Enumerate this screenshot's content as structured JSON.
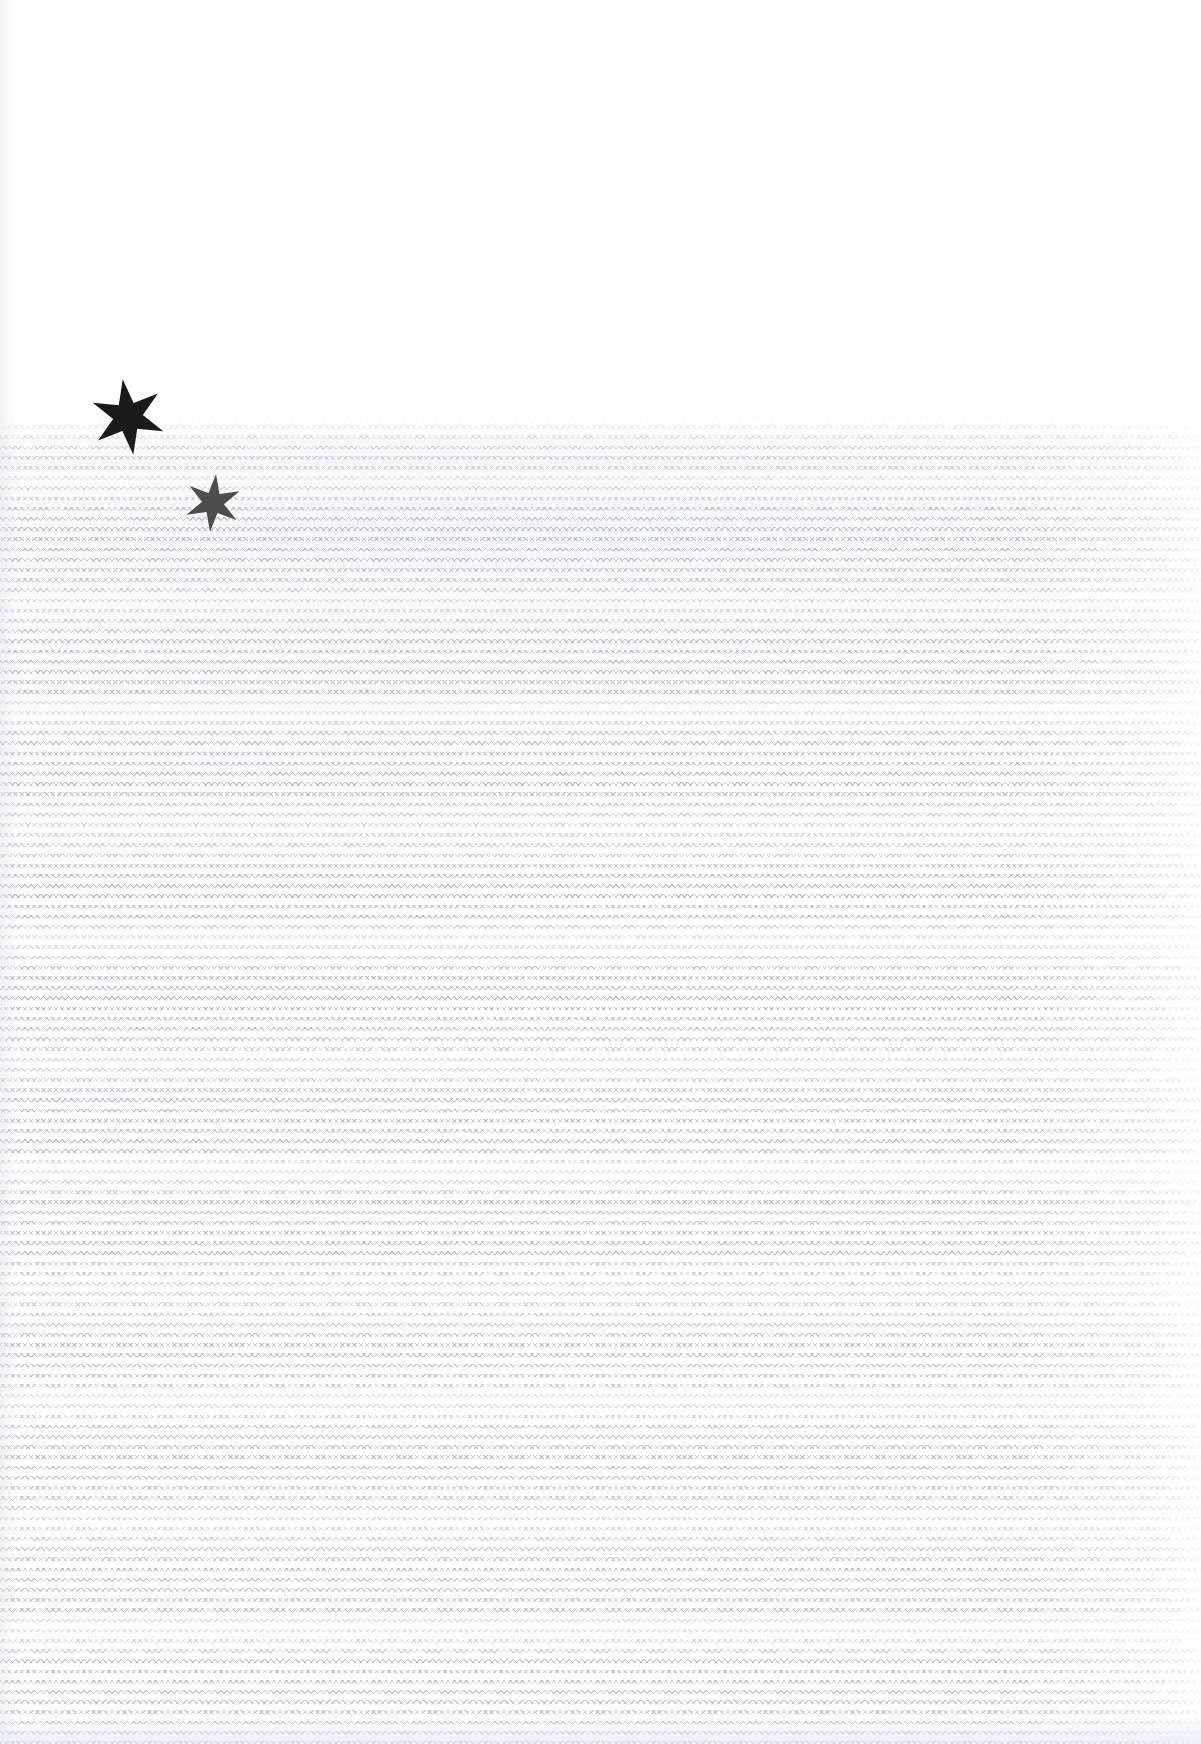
{
  "document": {
    "kind": "scanned-page",
    "title": "Scanned paper sheet with hatched field and star marks",
    "page_width": 1201,
    "page_height": 1744,
    "background_color": "#ffffff",
    "visible_text": "",
    "note": "No legible text is rendered on this page."
  },
  "regions": {
    "blank_upper": {
      "name": "blank upper margin",
      "top": 0,
      "height": 415,
      "fill_color": "#ffffff"
    },
    "textured_lower": {
      "name": "hatched texture field",
      "top": 415,
      "height": 1329,
      "ink_color": "#9a9ea6",
      "row_period_px": 10,
      "pattern": "horizontal rows of fine zig-zag cross-hatch marks"
    }
  },
  "marks": [
    {
      "id": "star-large",
      "name": "six-pointed star mark, large",
      "color": "#1a1a1a",
      "center_x": 128,
      "center_y": 417,
      "outer_radius": 38,
      "inner_radius": 15,
      "rotation_deg": -8
    },
    {
      "id": "star-small",
      "name": "six-pointed star mark, small",
      "color": "#4d4d4d",
      "center_x": 213,
      "center_y": 503,
      "outer_radius": 29,
      "inner_radius": 11,
      "rotation_deg": 6
    }
  ],
  "palette": {
    "paper": "#ffffff",
    "paper_grain": "#e9ebef",
    "texture_ink": "#9a9ea6",
    "mark_dark": "#1a1a1a",
    "mark_mid": "#4d4d4d"
  }
}
